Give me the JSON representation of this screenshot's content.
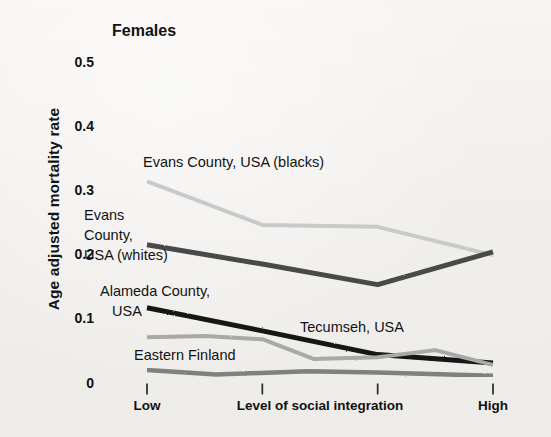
{
  "figure": {
    "title": "Females",
    "ylabel": "Age adjusted mortality rate",
    "xlabel": "Level of social integration",
    "background_color": "#f4f2ef"
  },
  "chart_data": {
    "type": "line",
    "title": "Females",
    "xlabel": "Level of social integration",
    "ylabel": "Age adjusted mortality rate",
    "ylim": [
      0,
      0.5
    ],
    "yticks": [
      0,
      0.1,
      0.2,
      0.3,
      0.4,
      0.5
    ],
    "ytick_labels": [
      "0",
      "0.1",
      "0.2",
      "0.3",
      "0.4",
      "0.5"
    ],
    "x": [
      1,
      2,
      3,
      4
    ],
    "xtick_labels": [
      "Low",
      "",
      "",
      "High"
    ],
    "xlim": [
      1,
      4
    ],
    "grid": true,
    "grid_axis": "y",
    "legend": "inline-annotations",
    "series": [
      {
        "name": "Evans County, USA (blacks)",
        "color": "#c9c9c9",
        "width": 4,
        "x": [
          1,
          2,
          3,
          4
        ],
        "values": [
          0.315,
          0.247,
          0.244,
          0.2
        ]
      },
      {
        "name": "Evans County, USA (whites)",
        "color": "#4a4a4a",
        "width": 5,
        "x": [
          1,
          2,
          3,
          4
        ],
        "values": [
          0.216,
          0.186,
          0.154,
          0.205
        ]
      },
      {
        "name": "Alameda County, USA",
        "color": "#151515",
        "width": 5,
        "x": [
          1,
          2,
          3,
          4
        ],
        "values": [
          0.118,
          0.082,
          0.045,
          0.032
        ]
      },
      {
        "name": "Tecumseh, USA",
        "color": "#a8a8a8",
        "width": 4,
        "x": [
          1,
          1.5,
          2,
          2.45,
          3,
          3.5,
          4
        ],
        "values": [
          0.072,
          0.074,
          0.069,
          0.038,
          0.041,
          0.052,
          0.029
        ]
      },
      {
        "name": "Eastern Finland",
        "color": "#808080",
        "width": 4.5,
        "x": [
          1,
          1.6,
          2.4,
          3,
          4
        ],
        "values": [
          0.021,
          0.014,
          0.019,
          0.017,
          0.012
        ]
      }
    ],
    "annotations": [
      {
        "text": "Evans County, USA (blacks)",
        "x_px": 143,
        "y_px": 155
      },
      {
        "text": "Evans",
        "x_px": 84,
        "y_px": 208
      },
      {
        "text": "County,",
        "x_px": 84,
        "y_px": 228
      },
      {
        "text": "USA (whites)",
        "x_px": 84,
        "y_px": 248
      },
      {
        "text": "Alameda County,",
        "x_px": 100,
        "y_px": 284
      },
      {
        "text": "USA",
        "x_px": 112,
        "y_px": 304
      },
      {
        "text": "Tecumseh, USA",
        "x_px": 300,
        "y_px": 320
      },
      {
        "text": "Eastern Finland",
        "x_px": 134,
        "y_px": 348
      }
    ]
  },
  "axes": {
    "y_ticks": [
      {
        "label": "0.5",
        "value": 0.5
      },
      {
        "label": "0.4",
        "value": 0.4
      },
      {
        "label": "0.3",
        "value": 0.3
      },
      {
        "label": "0.2",
        "value": 0.2
      },
      {
        "label": "0.1",
        "value": 0.1
      },
      {
        "label": "0",
        "value": 0
      }
    ],
    "x_ticks": [
      {
        "label": "Low",
        "value": 1
      },
      {
        "label": "",
        "value": 2
      },
      {
        "label": "",
        "value": 3
      },
      {
        "label": "High",
        "value": 4
      }
    ],
    "x_axis_title": "Level of social integration"
  }
}
